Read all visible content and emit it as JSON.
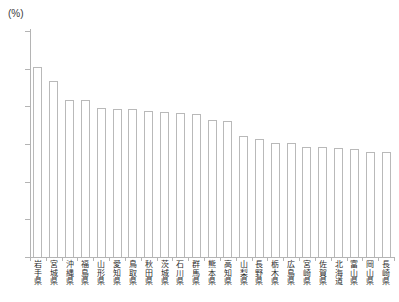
{
  "chart_data": {
    "type": "bar",
    "title": "",
    "subtitle": "",
    "xlabel": "",
    "ylabel": "",
    "unit_label": "(%)",
    "ylim": [
      0,
      30
    ],
    "yticks": [
      0,
      5,
      10,
      15,
      20,
      25,
      30
    ],
    "ytick_labels": [
      "0",
      "5",
      "10",
      "15",
      "20",
      "25",
      "30"
    ],
    "grid": false,
    "legend": null,
    "categories": [
      "岩手県",
      "宮城県",
      "沖縄県",
      "福島県",
      "山形県",
      "愛知県",
      "鳥取県",
      "秋田県",
      "茨城県",
      "石川県",
      "群馬県",
      "熊本県",
      "高知県",
      "山梨県",
      "長野県",
      "栃木県",
      "広島県",
      "宮崎県",
      "佐賀県",
      "北海道",
      "富山県",
      "岡山県",
      "長崎県"
    ],
    "values": [
      25.2,
      23.4,
      20.9,
      20.9,
      19.8,
      19.6,
      19.6,
      19.4,
      19.2,
      19.1,
      19.0,
      18.2,
      18.1,
      16.1,
      15.6,
      15.1,
      15.1,
      14.6,
      14.6,
      14.5,
      14.3,
      14.0,
      14.0
    ],
    "bar_style": {
      "fill": "#ffffff",
      "stroke": "#b9b9b9"
    },
    "axis_color": "#b4b4b4"
  }
}
